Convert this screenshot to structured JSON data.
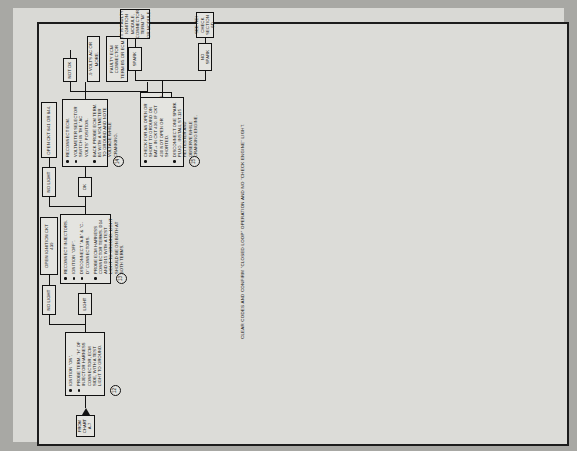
{
  "document": {
    "type": "diagnostic-flowchart",
    "orientation": "rotated-90-ccw",
    "bottom_note": "CLEAR CODES AND CONFIRM \"CLOSED LOOP\" OPERATION AND NO \"CHECK ENGINE\" LIGHT."
  },
  "start": {
    "line1": "FROM",
    "line2": "CHART",
    "line3": "A-7"
  },
  "branch_labels": {
    "no_light_1": "NO LIGHT",
    "light": "LIGHT",
    "no_light_2": "NO LIGHT",
    "ok": "OK",
    "not_ok": "NOT OK",
    "less_than": "LESS THAN .9 VOLTS AC",
    "nine_volts_or_more": ".9 VOLTS AC OR MORE.",
    "spark": "SPARK",
    "no_spark": "NO SPARK"
  },
  "steps": [
    {
      "id": "step-12",
      "number": "12",
      "bullets": [
        "IGNITION \"ON\".",
        "PROBE TERM. \"H\" OF INJECTOR HARNESS CONNECTOR, ECM SIDE, WITH A TEST LIGHT TO GROUND."
      ]
    },
    {
      "id": "step-13",
      "number": "13",
      "bullets": [
        "RECONNECT INJECTORS.",
        "IGNITION \"OFF\".",
        "DISCONNECT \"A-B\" & \"C-D\" CONNECTORS.",
        "PROBE ECM HARNESS CONNECTOR TERMS. D14 AND D15 WITH A TEST LIGHT TO GROUND. LIGHT SHOULD BE ON BOTH AT BOTH TERMS."
      ]
    },
    {
      "id": "step-14",
      "number": "14",
      "bullets": [
        "RECONNECT ECM.",
        "VOLTMETER SELECTOR SWITCH IN THE \"AC VOLTS\" POSITION.",
        "BACK PROBE ECM TERM. B5 WITH A VOLTMETER TO GROUND AND NOTE VOLTAGE WHILE CRANKING."
      ]
    },
    {
      "id": "step-15",
      "number": "15",
      "bullets": [
        "CHECK FOR AN OPEN OR SHORT TO GROUND ON BAT.+ IN CKT 430. IF CKT 430 NOT OPEN OR SHORTED.",
        "DISCONNECT ONE SPARK PLUG . INSTALL ST-125 HEI TESTER AND OBSERVE WHILE CRANKING ENGINE."
      ]
    }
  ],
  "results": [
    {
      "id": "result-open-ignition",
      "text": "OPEN IGNITION CKT 439"
    },
    {
      "id": "result-open-ckt",
      "text": "OPEN CKT 841 OR 844."
    },
    {
      "id": "result-faulty-ecm",
      "text": "FAULTY ECM CONNECTOR TERM B5 OR ECM."
    },
    {
      "id": "result-faulty-module",
      "text": "IT IS FAULTY IGNITION MODULE, CONNECTOR TERM \"M\" OR MODULE."
    },
    {
      "id": "result-see-hei",
      "text": "SEE HEI CHECK SECTION 6D"
    }
  ],
  "colors": {
    "ink": "#111111",
    "paper": "#dcdcd8",
    "board": "#a8a8a4"
  }
}
